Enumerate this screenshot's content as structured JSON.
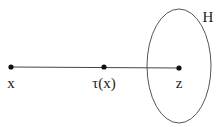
{
  "diagram": {
    "points": [
      {
        "id": "x",
        "label": "x",
        "cx": 11,
        "cy": 67,
        "lx": 11,
        "ly": 88
      },
      {
        "id": "tau-x",
        "label": "τ(x)",
        "cx": 104,
        "cy": 67,
        "lx": 104,
        "ly": 88
      },
      {
        "id": "z",
        "label": "z",
        "cx": 179,
        "cy": 68,
        "lx": 179,
        "ly": 88
      }
    ],
    "segment": {
      "from": "x",
      "to": "z"
    },
    "set": {
      "label": "H",
      "cx": 179,
      "cy": 66,
      "rx": 32,
      "ry": 57,
      "lx": 208,
      "ly": 22
    },
    "colors": {
      "stroke": "#444444",
      "dot": "#111111",
      "text": "#222222"
    }
  }
}
